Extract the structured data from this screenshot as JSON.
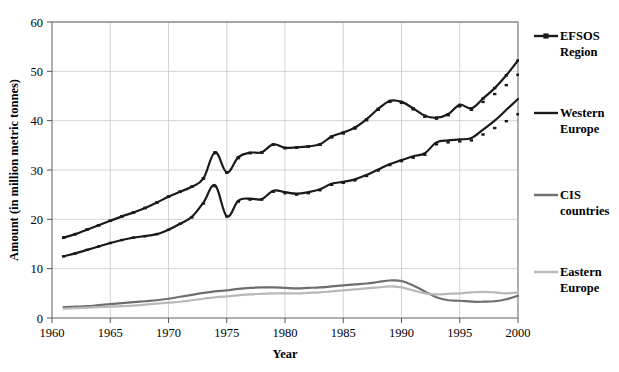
{
  "chart_data": {
    "type": "line",
    "title": "",
    "xlabel": "Year",
    "ylabel": "Amount (in million metric tonnes)",
    "xlim": [
      1960,
      2000
    ],
    "ylim": [
      0,
      60
    ],
    "xticks": [
      1960,
      1965,
      1970,
      1975,
      1980,
      1985,
      1990,
      1995,
      2000
    ],
    "xtick_labels": [
      "1960",
      "1965",
      "1970",
      "1975",
      "1980",
      "1985",
      "1990",
      "1995",
      "2000"
    ],
    "yticks": [
      0,
      10,
      20,
      30,
      40,
      50,
      60
    ],
    "ytick_labels": [
      "0",
      "10",
      "20",
      "30",
      "40",
      "50",
      "60"
    ],
    "grid": "horizontal-and-vertical-light",
    "legend_position": "right-outside",
    "x": [
      1961,
      1962,
      1963,
      1964,
      1965,
      1966,
      1967,
      1968,
      1969,
      1970,
      1971,
      1972,
      1973,
      1974,
      1975,
      1976,
      1977,
      1978,
      1979,
      1980,
      1981,
      1982,
      1983,
      1984,
      1985,
      1986,
      1987,
      1988,
      1989,
      1990,
      1991,
      1992,
      1993,
      1994,
      1995,
      1996,
      1997,
      1998,
      1999,
      2000
    ],
    "series": [
      {
        "name": "EFSOS Region",
        "color": "#1a1a1a",
        "marker": "square",
        "linewidth": 2.2,
        "values": [
          16.3,
          17.0,
          17.9,
          18.8,
          19.7,
          20.6,
          21.4,
          22.3,
          23.4,
          24.6,
          25.6,
          26.6,
          28.3,
          33.6,
          29.5,
          32.6,
          33.5,
          33.6,
          35.2,
          34.5,
          34.6,
          34.8,
          35.2,
          36.8,
          37.6,
          38.6,
          40.3,
          42.4,
          44.0,
          43.8,
          42.5,
          41.0,
          40.6,
          41.3,
          43.2,
          42.5,
          44.5,
          46.6,
          49.2,
          52.2
        ]
      },
      {
        "name": "EFSOS Region markers",
        "color": "#1a1a1a",
        "marker": "square-only",
        "linewidth": 0,
        "values": [
          16.3,
          17.0,
          17.9,
          18.8,
          19.7,
          20.6,
          21.4,
          22.3,
          23.4,
          24.6,
          25.6,
          26.6,
          28.3,
          33.4,
          29.5,
          32.4,
          33.4,
          33.5,
          35.1,
          34.4,
          34.5,
          34.7,
          35.1,
          36.6,
          37.4,
          38.4,
          40.1,
          42.2,
          43.8,
          43.6,
          42.3,
          40.8,
          40.4,
          41.1,
          42.9,
          42.2,
          43.8,
          45.4,
          47.2,
          49.3
        ]
      },
      {
        "name": "Western Europe",
        "color": "#1a1a1a",
        "marker": "none",
        "linewidth": 2.2,
        "values": [
          12.5,
          13.1,
          13.8,
          14.5,
          15.2,
          15.8,
          16.3,
          16.6,
          17.0,
          17.9,
          19.1,
          20.5,
          23.4,
          26.9,
          20.6,
          23.8,
          24.2,
          24.1,
          25.8,
          25.5,
          25.2,
          25.5,
          26.1,
          27.2,
          27.6,
          28.1,
          29.0,
          30.1,
          31.2,
          32.0,
          32.8,
          33.4,
          35.6,
          36.0,
          36.2,
          36.5,
          38.2,
          40.0,
          42.2,
          44.4
        ]
      },
      {
        "name": "Western Europe markers",
        "color": "#1a1a1a",
        "marker": "square-only",
        "linewidth": 0,
        "values": [
          12.5,
          13.1,
          13.8,
          14.5,
          15.2,
          15.8,
          16.3,
          16.6,
          17.0,
          17.9,
          19.1,
          20.4,
          23.2,
          26.7,
          20.6,
          23.6,
          24.0,
          24.0,
          25.6,
          25.3,
          25.0,
          25.3,
          25.9,
          27.0,
          27.4,
          27.9,
          28.8,
          29.9,
          31.0,
          31.8,
          32.5,
          33.1,
          35.2,
          35.6,
          35.8,
          36.0,
          37.2,
          38.5,
          39.9,
          41.3
        ]
      },
      {
        "name": "CIS countries",
        "color": "#6e6e6e",
        "marker": "none",
        "linewidth": 2.2,
        "values": [
          2.2,
          2.3,
          2.4,
          2.6,
          2.8,
          3.0,
          3.2,
          3.4,
          3.6,
          3.9,
          4.3,
          4.7,
          5.1,
          5.4,
          5.6,
          5.9,
          6.1,
          6.2,
          6.2,
          6.1,
          6.0,
          6.1,
          6.2,
          6.4,
          6.6,
          6.8,
          7.0,
          7.3,
          7.6,
          7.5,
          6.6,
          5.4,
          4.2,
          3.6,
          3.5,
          3.3,
          3.3,
          3.4,
          3.8,
          4.5
        ]
      },
      {
        "name": "Eastern Europe",
        "color": "#b8b8b8",
        "marker": "none",
        "linewidth": 2.2,
        "values": [
          1.9,
          2.0,
          2.1,
          2.2,
          2.3,
          2.4,
          2.5,
          2.7,
          2.9,
          3.1,
          3.3,
          3.6,
          3.9,
          4.2,
          4.4,
          4.6,
          4.8,
          4.9,
          5.0,
          5.0,
          5.0,
          5.1,
          5.2,
          5.4,
          5.6,
          5.8,
          6.0,
          6.2,
          6.4,
          6.2,
          5.6,
          5.0,
          4.8,
          4.9,
          5.0,
          5.2,
          5.3,
          5.2,
          5.0,
          5.2
        ]
      }
    ],
    "legend": [
      {
        "label_line1": "EFSOS",
        "label_line2": "Region",
        "color": "#1a1a1a",
        "marker": "square"
      },
      {
        "label_line1": "Western",
        "label_line2": "Europe",
        "color": "#1a1a1a",
        "marker": "none"
      },
      {
        "label_line1": "CIS",
        "label_line2": "countries",
        "color": "#6e6e6e",
        "marker": "none"
      },
      {
        "label_line1": "Eastern",
        "label_line2": "Europe",
        "color": "#b8b8b8",
        "marker": "none"
      }
    ]
  }
}
